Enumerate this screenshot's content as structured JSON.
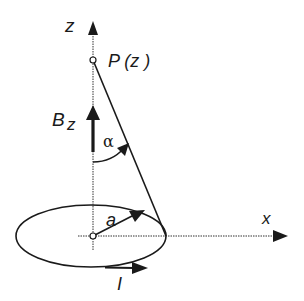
{
  "figure": {
    "labels": {
      "z_axis": "z",
      "x_axis": "x",
      "point": "P (z )",
      "field_B": "B",
      "field_sub": "z",
      "angle": "α",
      "radius": "a",
      "current": "I"
    },
    "colors": {
      "ink": "#1a1a1a",
      "background": "#ffffff"
    },
    "geometry": {
      "origin": [
        93,
        236
      ],
      "point_P": [
        93,
        60
      ],
      "loop_rx": 75,
      "loop_ry": 31
    }
  }
}
